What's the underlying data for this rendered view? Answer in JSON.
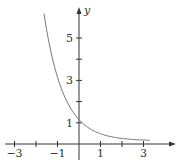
{
  "chart_data": {
    "type": "line",
    "title": "",
    "function": "y = (1/3)^x",
    "xlabel": "",
    "ylabel": "y",
    "xlim": [
      -3.5,
      4
    ],
    "ylim": [
      -0.5,
      6.5
    ],
    "x_ticks": [
      -3,
      -2,
      -1,
      0,
      1,
      2,
      3
    ],
    "x_tick_labels": [
      "-3",
      "-1",
      "1",
      "3"
    ],
    "y_ticks": [
      1,
      2,
      3,
      4,
      5
    ],
    "y_tick_labels": [
      "1",
      "3",
      "5"
    ],
    "grid": false,
    "legend": null,
    "series": [
      {
        "name": "curve",
        "color": "#777777",
        "x": [
          -1.63,
          -1.5,
          -1.25,
          -1,
          -0.75,
          -0.5,
          -0.25,
          0,
          0.5,
          1,
          1.5,
          2,
          2.5,
          3,
          3.3
        ],
        "y": [
          6.0,
          5.2,
          3.95,
          3.0,
          2.28,
          1.73,
          1.32,
          1.0,
          0.58,
          0.33,
          0.19,
          0.11,
          0.06,
          0.04,
          0.03
        ]
      }
    ]
  },
  "labels": {
    "y_axis": "y",
    "x_neg3": "−3",
    "x_neg1": "−1",
    "x_1": "1",
    "x_3": "3",
    "y_1": "1",
    "y_3": "3",
    "y_5": "5"
  }
}
